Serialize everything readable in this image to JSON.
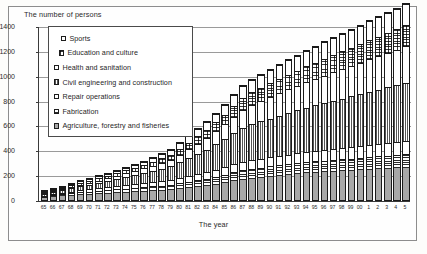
{
  "chart_data": {
    "type": "bar",
    "stacked": true,
    "title": "",
    "ylabel": "The number of persons",
    "xlabel": "The year",
    "ylim": [
      0,
      1400
    ],
    "yticks": [
      0,
      200,
      400,
      600,
      800,
      1000,
      1200,
      1400
    ],
    "grid": true,
    "legend_position": "top-left",
    "categories": [
      "65",
      "66",
      "67",
      "68",
      "69",
      "70",
      "71",
      "72",
      "73",
      "74",
      "75",
      "76",
      "77",
      "78",
      "79",
      "80",
      "81",
      "82",
      "83",
      "84",
      "85",
      "86",
      "87",
      "88",
      "89",
      "90",
      "91",
      "92",
      "93",
      "94",
      "95",
      "96",
      "97",
      "98",
      "99",
      "00",
      "1",
      "2",
      "3",
      "4",
      "5"
    ],
    "series": [
      {
        "name": "Agriculture, forestry and fisheries",
        "pattern": "solid-gray",
        "values": [
          18,
          26,
          30,
          34,
          38,
          42,
          46,
          50,
          54,
          58,
          62,
          66,
          70,
          74,
          78,
          86,
          94,
          102,
          112,
          124,
          136,
          150,
          162,
          172,
          180,
          188,
          196,
          202,
          208,
          214,
          218,
          222,
          226,
          230,
          234,
          238,
          242,
          246,
          250,
          254,
          258
        ]
      },
      {
        "name": "Fabrication",
        "pattern": "horizontal-lines",
        "values": [
          10,
          14,
          18,
          20,
          24,
          26,
          28,
          30,
          32,
          34,
          36,
          38,
          40,
          42,
          44,
          48,
          52,
          56,
          60,
          64,
          68,
          72,
          76,
          78,
          80,
          82,
          84,
          86,
          88,
          90,
          92,
          94,
          96,
          98,
          100,
          102,
          104,
          106,
          108,
          110,
          112
        ]
      },
      {
        "name": "Repair operations",
        "pattern": "white",
        "values": [
          8,
          10,
          12,
          14,
          16,
          18,
          20,
          22,
          24,
          26,
          28,
          30,
          32,
          34,
          36,
          40,
          44,
          48,
          52,
          56,
          60,
          64,
          68,
          70,
          72,
          74,
          76,
          78,
          80,
          82,
          84,
          86,
          88,
          90,
          92,
          94,
          96,
          98,
          100,
          102,
          104
        ]
      },
      {
        "name": "Civil engineering and construction",
        "pattern": "vertical-lines",
        "values": [
          12,
          16,
          20,
          26,
          32,
          38,
          44,
          50,
          58,
          66,
          74,
          82,
          92,
          102,
          112,
          128,
          146,
          164,
          182,
          204,
          226,
          250,
          272,
          290,
          300,
          312,
          322,
          334,
          346,
          358,
          368,
          378,
          388,
          398,
          408,
          418,
          428,
          438,
          448,
          458,
          468
        ]
      },
      {
        "name": "Health and sanitation",
        "pattern": "white",
        "values": [
          6,
          8,
          10,
          12,
          14,
          16,
          18,
          22,
          26,
          30,
          34,
          38,
          44,
          50,
          56,
          64,
          74,
          84,
          94,
          106,
          118,
          132,
          146,
          158,
          166,
          174,
          182,
          190,
          198,
          206,
          214,
          222,
          230,
          238,
          246,
          254,
          262,
          270,
          278,
          286,
          294
        ]
      },
      {
        "name": "Education and culture",
        "pattern": "cross-hatch",
        "values": [
          6,
          8,
          10,
          12,
          14,
          16,
          18,
          20,
          22,
          24,
          26,
          28,
          32,
          36,
          40,
          46,
          52,
          58,
          64,
          72,
          80,
          88,
          96,
          102,
          106,
          110,
          114,
          118,
          122,
          126,
          130,
          134,
          138,
          142,
          146,
          150,
          154,
          158,
          162,
          166,
          170
        ]
      },
      {
        "name": "Sports",
        "pattern": "white",
        "values": [
          4,
          6,
          8,
          10,
          12,
          14,
          16,
          18,
          20,
          22,
          24,
          26,
          30,
          34,
          38,
          44,
          50,
          56,
          62,
          70,
          78,
          86,
          94,
          100,
          104,
          108,
          112,
          116,
          120,
          124,
          128,
          132,
          136,
          140,
          144,
          148,
          152,
          156,
          160,
          164,
          168
        ]
      }
    ]
  },
  "legend": {
    "items": [
      {
        "label": "Sports",
        "pattern": "white"
      },
      {
        "label": "Education and culture",
        "pattern": "cross-hatch"
      },
      {
        "label": "Health and sanitation",
        "pattern": "white"
      },
      {
        "label": "Civil engineering and construction",
        "pattern": "vertical-lines"
      },
      {
        "label": "Repair operations",
        "pattern": "white"
      },
      {
        "label": "Fabrication",
        "pattern": "horizontal-lines"
      },
      {
        "label": "Agriculture, forestry and fisheries",
        "pattern": "solid-gray"
      }
    ]
  }
}
